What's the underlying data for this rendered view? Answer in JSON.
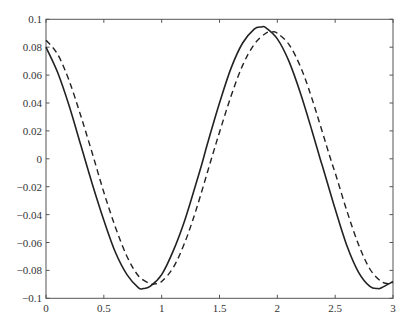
{
  "chart_data": {
    "type": "line",
    "title": "",
    "xlabel": "",
    "ylabel": "",
    "xlim": [
      0,
      3
    ],
    "ylim": [
      -0.1,
      0.1
    ],
    "grid": false,
    "legend": null,
    "x_ticks": [
      0,
      0.5,
      1,
      1.5,
      2,
      2.5,
      3
    ],
    "x_tick_labels": [
      "0",
      "0.5",
      "1",
      "1.5",
      "2",
      "2.5",
      "3"
    ],
    "y_ticks": [
      -0.1,
      -0.08,
      -0.06,
      -0.04,
      -0.02,
      0,
      0.02,
      0.04,
      0.06,
      0.08,
      0.1
    ],
    "y_tick_labels": [
      "−0.1",
      "−0.08",
      "−0.06",
      "−0.04",
      "−0.02",
      "0",
      "0.02",
      "0.04",
      "0.06",
      "0.08",
      "0.1"
    ],
    "series": [
      {
        "name": "solid",
        "style": "solid",
        "color": "#222222",
        "x": [
          0,
          0.1,
          0.2,
          0.3,
          0.4,
          0.5,
          0.6,
          0.7,
          0.8,
          0.84,
          0.9,
          1.0,
          1.1,
          1.2,
          1.3,
          1.35,
          1.4,
          1.5,
          1.6,
          1.7,
          1.8,
          1.86,
          1.9,
          2.0,
          2.1,
          2.2,
          2.3,
          2.37,
          2.4,
          2.5,
          2.6,
          2.7,
          2.8,
          2.87,
          2.9,
          3.0
        ],
        "y": [
          0.08,
          0.062,
          0.038,
          0.01,
          -0.018,
          -0.044,
          -0.067,
          -0.083,
          -0.0925,
          -0.093,
          -0.0915,
          -0.083,
          -0.066,
          -0.044,
          -0.017,
          -0.003,
          0.012,
          0.04,
          0.065,
          0.083,
          0.093,
          0.0945,
          0.094,
          0.086,
          0.07,
          0.047,
          0.02,
          0.0,
          -0.008,
          -0.036,
          -0.062,
          -0.081,
          -0.0915,
          -0.093,
          -0.0925,
          -0.088
        ]
      },
      {
        "name": "dashed",
        "style": "dashed",
        "color": "#222222",
        "x": [
          0,
          0.1,
          0.2,
          0.3,
          0.4,
          0.5,
          0.6,
          0.7,
          0.8,
          0.9,
          0.94,
          1.0,
          1.1,
          1.2,
          1.3,
          1.43,
          1.5,
          1.6,
          1.7,
          1.8,
          1.9,
          1.96,
          2.0,
          2.1,
          2.2,
          2.3,
          2.46,
          2.5,
          2.6,
          2.7,
          2.8,
          2.9,
          2.97,
          3.0
        ],
        "y": [
          0.085,
          0.075,
          0.056,
          0.031,
          0.004,
          -0.024,
          -0.049,
          -0.07,
          -0.084,
          -0.0895,
          -0.0897,
          -0.088,
          -0.078,
          -0.06,
          -0.036,
          0.0,
          0.019,
          0.045,
          0.067,
          0.082,
          0.09,
          0.091,
          0.09,
          0.082,
          0.066,
          0.043,
          0.0,
          -0.01,
          -0.037,
          -0.061,
          -0.079,
          -0.088,
          -0.0895,
          -0.089
        ]
      }
    ]
  }
}
